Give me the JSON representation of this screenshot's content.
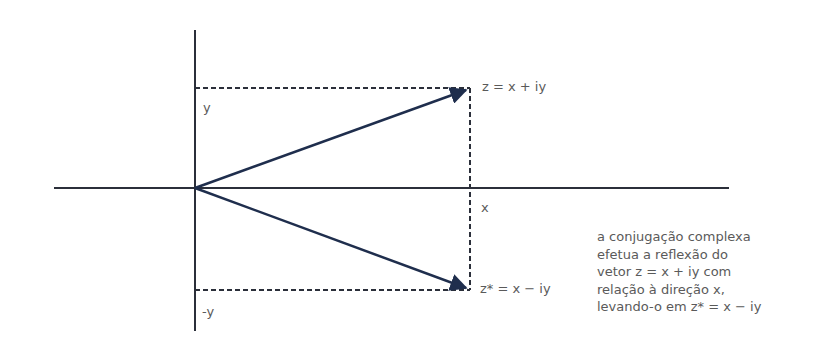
{
  "diagram": {
    "labels": {
      "z": "z = x + iy",
      "z_conj": "z* = x − iy",
      "y": "y",
      "neg_y": "-y",
      "x": "x"
    },
    "caption": [
      "a conjugação complexa",
      "efetua a reflexão do",
      "vetor z = x + iy com",
      "relação à direção x,",
      "levando-o em z* = x − iy"
    ],
    "colors": {
      "axis": "#2b2f3a",
      "vector": "#1f2e4d",
      "dashed": "#2b2f3a",
      "text": "#5a5a5a"
    }
  }
}
